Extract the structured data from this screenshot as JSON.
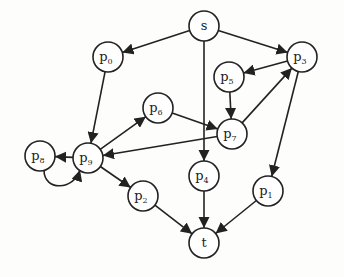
{
  "diagram": {
    "type": "directed-graph",
    "colors": {
      "stroke": "#222222",
      "background": "#fdfdfc"
    },
    "nodes": [
      {
        "id": "s",
        "label": "s",
        "sub": "",
        "x": 204,
        "y": 26
      },
      {
        "id": "p0",
        "label": "p",
        "sub": "0",
        "x": 108,
        "y": 57
      },
      {
        "id": "p3",
        "label": "p",
        "sub": "3",
        "x": 302,
        "y": 57
      },
      {
        "id": "p5",
        "label": "p",
        "sub": "5",
        "x": 229,
        "y": 77
      },
      {
        "id": "p6",
        "label": "p",
        "sub": "6",
        "x": 158,
        "y": 108
      },
      {
        "id": "p7",
        "label": "p",
        "sub": "7",
        "x": 232,
        "y": 134
      },
      {
        "id": "p9",
        "label": "p",
        "sub": "9",
        "x": 88,
        "y": 158
      },
      {
        "id": "p8",
        "label": "p",
        "sub": "8",
        "x": 40,
        "y": 156
      },
      {
        "id": "p4",
        "label": "p",
        "sub": "4",
        "x": 204,
        "y": 176
      },
      {
        "id": "p1",
        "label": "p",
        "sub": "1",
        "x": 268,
        "y": 191
      },
      {
        "id": "p2",
        "label": "p",
        "sub": "2",
        "x": 143,
        "y": 196
      },
      {
        "id": "t",
        "label": "t",
        "sub": "",
        "x": 204,
        "y": 243
      }
    ],
    "edges": [
      {
        "from": "s",
        "to": "p0"
      },
      {
        "from": "s",
        "to": "p3"
      },
      {
        "from": "s",
        "to": "p4"
      },
      {
        "from": "p0",
        "to": "p9"
      },
      {
        "from": "p9",
        "to": "p6"
      },
      {
        "from": "p6",
        "to": "p7"
      },
      {
        "from": "p3",
        "to": "p5"
      },
      {
        "from": "p5",
        "to": "p7"
      },
      {
        "from": "p7",
        "to": "p3"
      },
      {
        "from": "p7",
        "to": "p9"
      },
      {
        "from": "p9",
        "to": "p8"
      },
      {
        "from": "p8",
        "to": "p9",
        "curved": true
      },
      {
        "from": "p9",
        "to": "p2"
      },
      {
        "from": "p3",
        "to": "p1"
      },
      {
        "from": "p1",
        "to": "t"
      },
      {
        "from": "p4",
        "to": "t"
      },
      {
        "from": "p2",
        "to": "t"
      }
    ],
    "node_radius": 15
  }
}
